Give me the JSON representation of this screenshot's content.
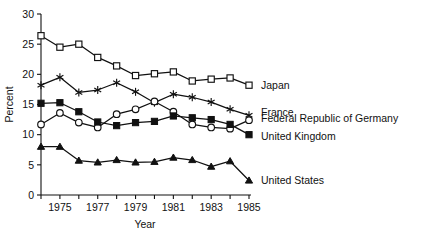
{
  "chart_data": {
    "type": "line",
    "title": "",
    "xlabel": "Year",
    "ylabel": "Percent",
    "xlim": [
      1974,
      1985
    ],
    "ylim": [
      0,
      30
    ],
    "yticks": [
      0,
      5,
      10,
      15,
      20,
      25,
      30
    ],
    "ytick_labels": [
      "0",
      "5",
      "10",
      "15",
      "20",
      "25",
      "30"
    ],
    "x": [
      1974,
      1975,
      1976,
      1977,
      1978,
      1979,
      1980,
      1981,
      1982,
      1983,
      1984,
      1985
    ],
    "xticks": [
      1974,
      1975,
      1976,
      1977,
      1978,
      1979,
      1980,
      1981,
      1982,
      1983,
      1984,
      1985
    ],
    "xtick_labels": [
      "",
      "1975",
      "",
      "1977",
      "",
      "1979",
      "",
      "1981",
      "",
      "1983",
      "",
      "1985"
    ],
    "grid": false,
    "legend_position": "right-inline",
    "series": [
      {
        "name": "Japan",
        "marker": "open-square",
        "values": [
          26.4,
          24.5,
          25.0,
          22.8,
          21.4,
          19.8,
          20.1,
          20.4,
          18.9,
          19.2,
          19.4,
          18.2
        ]
      },
      {
        "name": "France",
        "marker": "asterisk",
        "values": [
          18.2,
          19.5,
          17.0,
          17.4,
          18.6,
          17.1,
          15.3,
          16.7,
          16.2,
          15.4,
          14.2,
          13.2
        ]
      },
      {
        "name": "Federal Republic of Germany",
        "marker": "open-circle",
        "values": [
          11.7,
          13.6,
          12.0,
          11.2,
          13.4,
          14.2,
          15.5,
          13.8,
          11.7,
          11.2,
          11.0,
          12.4
        ]
      },
      {
        "name": "United Kingdom",
        "marker": "filled-square",
        "values": [
          15.2,
          15.3,
          13.8,
          12.1,
          11.5,
          12.0,
          12.2,
          13.1,
          12.8,
          12.5,
          11.7,
          10.0
        ]
      },
      {
        "name": "United States",
        "marker": "filled-triangle",
        "values": [
          8.0,
          8.0,
          5.7,
          5.4,
          5.8,
          5.4,
          5.5,
          6.2,
          5.8,
          4.7,
          5.6,
          2.4
        ]
      }
    ],
    "colors": {
      "line": "#111111",
      "axis": "#111111",
      "background": "#ffffff"
    }
  }
}
